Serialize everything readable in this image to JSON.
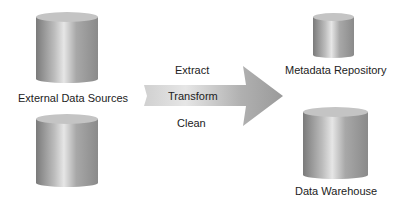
{
  "sources": {
    "label": "External Data Sources"
  },
  "arrow": {
    "top_label": "Extract",
    "middle_label": "Transform",
    "bottom_label": "Clean"
  },
  "metadata": {
    "label": "Metadata Repository"
  },
  "warehouse": {
    "label": "Data Warehouse"
  },
  "colors": {
    "cylinder_dark": "#777777",
    "cylinder_light": "#e0e0e0",
    "arrow_fill": "#b0b0b0"
  }
}
